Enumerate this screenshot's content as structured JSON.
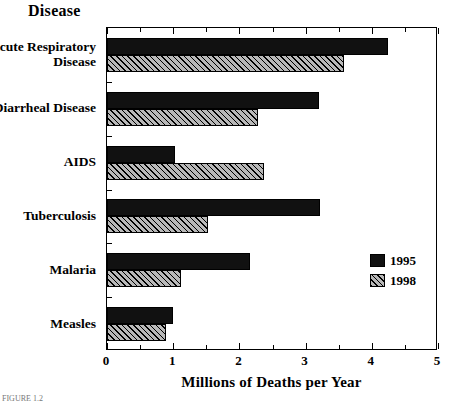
{
  "chart_data": {
    "type": "bar",
    "orientation": "horizontal",
    "title": "",
    "categories": [
      "Acute  Respiratory\nDisease",
      "Diarrheal Disease",
      "AIDS",
      "Tuberculosis",
      "Malaria",
      "Measles"
    ],
    "series": [
      {
        "name": "1995",
        "values": [
          4.25,
          3.2,
          1.03,
          3.22,
          2.16,
          0.99
        ]
      },
      {
        "name": "1998",
        "values": [
          3.58,
          2.28,
          2.37,
          1.53,
          1.12,
          0.89
        ]
      }
    ],
    "xlabel": "Millions of Deaths per Year",
    "ylabel": "Disease",
    "xlim": [
      0,
      5
    ],
    "xticks": [
      0,
      1,
      2,
      3,
      4,
      5
    ],
    "xtick_labels": [
      "0",
      "1",
      "2",
      "3",
      "4",
      "5"
    ],
    "xminor_ticks": [
      0.5,
      1.5,
      2.5,
      3.5,
      4.5
    ],
    "grid": false,
    "legend": [
      "1995",
      "1998"
    ],
    "legend_position": "center right",
    "colors": {
      "1995": "#111111",
      "1998": "#b8b8b8"
    }
  },
  "axis": {
    "y_heading": "Disease",
    "x_title": "Millions of Deaths per Year"
  },
  "legend": {
    "entries": [
      {
        "label": "1995"
      },
      {
        "label": "1998"
      }
    ]
  },
  "caption": {
    "text": "FIGURE 1.2"
  }
}
